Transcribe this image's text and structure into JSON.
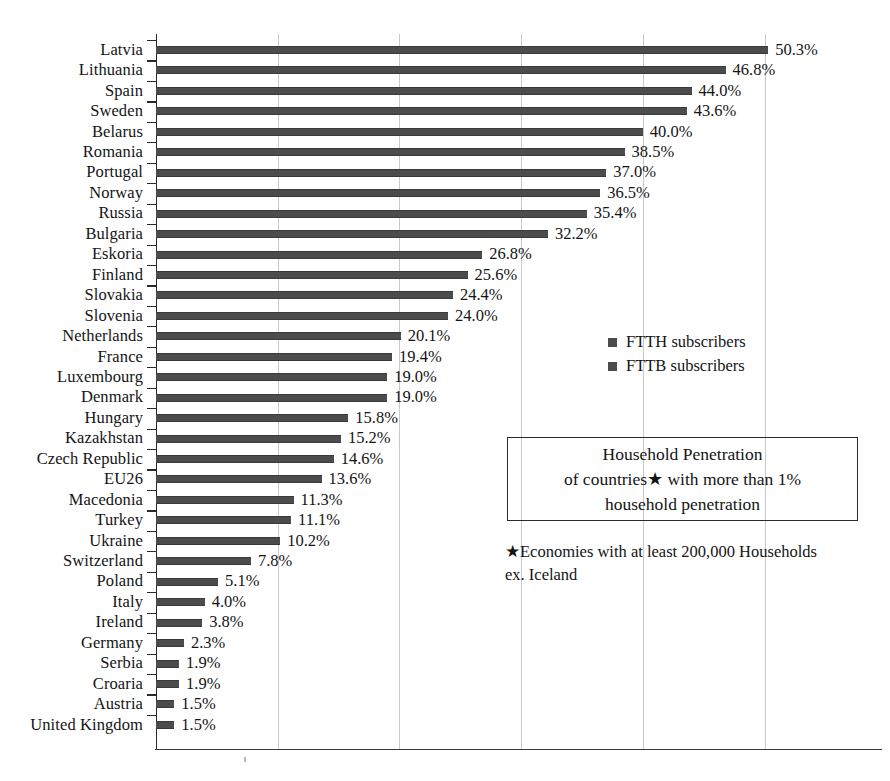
{
  "chart_data": {
    "type": "bar",
    "orientation": "horizontal",
    "xlabel": "",
    "ylabel": "",
    "xlim": [
      0,
      58.5
    ],
    "grid": true,
    "gridline_values": [
      10,
      20,
      30,
      40,
      50
    ],
    "value_suffix": "%",
    "legend_position": "right-middle",
    "categories": [
      "Latvia",
      "Lithuania",
      "Spain",
      "Sweden",
      "Belarus",
      "Romania",
      "Portugal",
      "Norway",
      "Russia",
      "Bulgaria",
      "Eskoria",
      "Finland",
      "Slovakia",
      "Slovenia",
      "Netherlands",
      "France",
      "Luxembourg",
      "Denmark",
      "Hungary",
      "Kazakhstan",
      "Czech Republic",
      "EU26",
      "Macedonia",
      "Turkey",
      "Ukraine",
      "Switzerland",
      "Poland",
      "Italy",
      "Ireland",
      "Germany",
      "Serbia",
      "Croaria",
      "Austria",
      "United Kingdom"
    ],
    "values": [
      50.3,
      46.8,
      44.0,
      43.6,
      40.0,
      38.5,
      37.0,
      36.5,
      35.4,
      32.2,
      26.8,
      25.6,
      24.4,
      24.0,
      20.1,
      19.4,
      19.0,
      19.0,
      15.8,
      15.2,
      14.6,
      13.6,
      11.3,
      11.1,
      10.2,
      7.8,
      5.1,
      4.0,
      3.8,
      2.3,
      1.9,
      1.9,
      1.5,
      1.5
    ],
    "value_labels": [
      "50.3%",
      "46.8%",
      "44.0%",
      "43.6%",
      "40.0%",
      "38.5%",
      "37.0%",
      "36.5%",
      "35.4%",
      "32.2%",
      "26.8%",
      "25.6%",
      "24.4%",
      "24.0%",
      "20.1%",
      "19.4%",
      "19.0%",
      "19.0%",
      "15.8%",
      "15.2%",
      "14.6%",
      "13.6%",
      "11.3%",
      "11.1%",
      "10.2%",
      "7.8%",
      "5.1%",
      "4.0%",
      "3.8%",
      "2.3%",
      "1.9%",
      "1.9%",
      "1.5%",
      "1.5%"
    ],
    "legend": [
      {
        "label": "FTTH subscribers",
        "color": "#4c4c4c"
      },
      {
        "label": "FTTB subscribers",
        "color": "#4c4c4c"
      }
    ],
    "title_lines": [
      "Household Penetration",
      "of countries★ with more than 1%",
      "household penetration"
    ],
    "footnote_lines": [
      "★Economies with at least 200,000 Households",
      "ex. Iceland"
    ],
    "colors": {
      "bar": "#4c4c4c",
      "bar_edge": "#3a3a3a",
      "grid": "#c9c9c9",
      "axis": "#2a2a2a",
      "text": "#141414",
      "background": "#ffffff"
    }
  }
}
